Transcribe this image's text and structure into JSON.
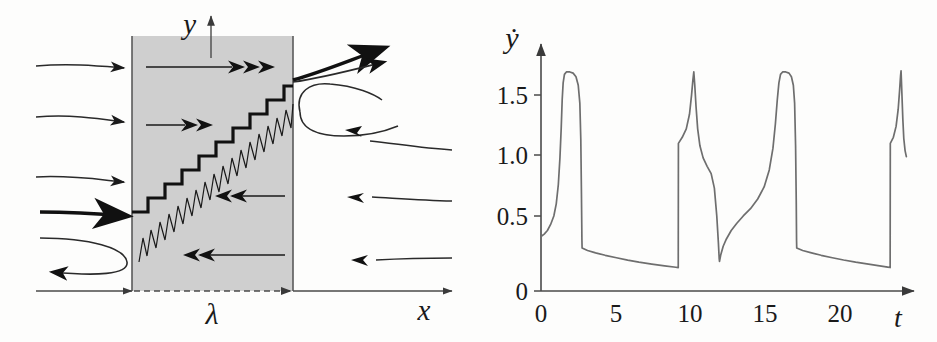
{
  "figure": {
    "panels": [
      {
        "id": "schematic",
        "name": "flow-schematic"
      },
      {
        "id": "plot",
        "name": "velocity-time-plot"
      }
    ]
  },
  "schematic": {
    "axis_x_label": "x",
    "axis_y_label": "y",
    "band_label": "λ",
    "band_fill": "#cfcfcf",
    "band_stroke": "#4a4a4a",
    "line_color": "#1a1a1a",
    "inflow_arrow_count": 4,
    "outflow_arrow_count": 4,
    "interior_right_arrow_count": 2,
    "interior_left_arrow_count": 2,
    "staircase_steps": 9
  },
  "chart_data": {
    "type": "line",
    "title": "",
    "xlabel": "t",
    "ylabel": "ẏ",
    "xlim": [
      0,
      22.8
    ],
    "ylim": [
      0,
      1.95
    ],
    "xticks": [
      0,
      5,
      10,
      15,
      20
    ],
    "xtick_labels": [
      "0",
      "5",
      "10",
      "15",
      "20"
    ],
    "yticks": [
      0,
      0.5,
      1.0,
      1.5
    ],
    "ytick_labels": [
      "0",
      "0.5",
      "1.0",
      "1.5"
    ],
    "grid": false,
    "legend": null,
    "line_color": "#6e6e6e",
    "series": [
      {
        "name": "ydot",
        "points": [
          [
            0.0,
            0.45
          ],
          [
            0.2,
            0.47
          ],
          [
            0.4,
            0.5
          ],
          [
            0.6,
            0.55
          ],
          [
            0.8,
            0.62
          ],
          [
            0.95,
            0.72
          ],
          [
            1.08,
            0.88
          ],
          [
            1.18,
            1.1
          ],
          [
            1.26,
            1.35
          ],
          [
            1.32,
            1.58
          ],
          [
            1.38,
            1.72
          ],
          [
            1.46,
            1.79
          ],
          [
            1.58,
            1.81
          ],
          [
            1.8,
            1.81
          ],
          [
            2.0,
            1.8
          ],
          [
            2.18,
            1.77
          ],
          [
            2.32,
            1.7
          ],
          [
            2.42,
            1.55
          ],
          [
            2.48,
            1.25
          ],
          [
            2.52,
            0.8
          ],
          [
            2.55,
            0.42
          ],
          [
            2.56,
            0.355
          ],
          [
            2.9,
            0.335
          ],
          [
            3.4,
            0.315
          ],
          [
            4.0,
            0.295
          ],
          [
            4.7,
            0.275
          ],
          [
            5.4,
            0.255
          ],
          [
            6.1,
            0.238
          ],
          [
            6.9,
            0.222
          ],
          [
            7.7,
            0.208
          ],
          [
            8.4,
            0.196
          ],
          [
            8.55,
            0.193
          ],
          [
            8.56,
            1.22
          ],
          [
            8.8,
            1.27
          ],
          [
            9.05,
            1.34
          ],
          [
            9.25,
            1.46
          ],
          [
            9.38,
            1.62
          ],
          [
            9.46,
            1.74
          ],
          [
            9.52,
            1.81
          ],
          [
            9.58,
            1.7
          ],
          [
            9.66,
            1.52
          ],
          [
            9.76,
            1.34
          ],
          [
            9.9,
            1.2
          ],
          [
            10.1,
            1.1
          ],
          [
            10.35,
            1.03
          ],
          [
            10.6,
            0.97
          ],
          [
            10.8,
            0.85
          ],
          [
            10.95,
            0.62
          ],
          [
            11.05,
            0.4
          ],
          [
            11.1,
            0.27
          ],
          [
            11.12,
            0.245
          ],
          [
            11.2,
            0.3
          ],
          [
            11.35,
            0.37
          ],
          [
            11.55,
            0.43
          ],
          [
            11.85,
            0.5
          ],
          [
            12.2,
            0.56
          ],
          [
            12.6,
            0.62
          ],
          [
            13.05,
            0.68
          ],
          [
            13.5,
            0.76
          ],
          [
            13.9,
            0.86
          ],
          [
            14.22,
            1.0
          ],
          [
            14.45,
            1.18
          ],
          [
            14.6,
            1.38
          ],
          [
            14.72,
            1.58
          ],
          [
            14.82,
            1.72
          ],
          [
            14.92,
            1.79
          ],
          [
            15.05,
            1.81
          ],
          [
            15.25,
            1.81
          ],
          [
            15.45,
            1.8
          ],
          [
            15.6,
            1.77
          ],
          [
            15.72,
            1.7
          ],
          [
            15.8,
            1.55
          ],
          [
            15.86,
            1.2
          ],
          [
            15.9,
            0.75
          ],
          [
            15.92,
            0.42
          ],
          [
            15.93,
            0.355
          ],
          [
            16.3,
            0.335
          ],
          [
            16.85,
            0.315
          ],
          [
            17.45,
            0.295
          ],
          [
            18.15,
            0.275
          ],
          [
            18.85,
            0.256
          ],
          [
            19.6,
            0.238
          ],
          [
            20.4,
            0.222
          ],
          [
            21.1,
            0.208
          ],
          [
            21.6,
            0.197
          ],
          [
            21.75,
            0.194
          ],
          [
            21.76,
            1.22
          ],
          [
            21.95,
            1.27
          ],
          [
            22.12,
            1.36
          ],
          [
            22.25,
            1.5
          ],
          [
            22.34,
            1.66
          ],
          [
            22.4,
            1.78
          ],
          [
            22.43,
            1.82
          ],
          [
            22.48,
            1.64
          ],
          [
            22.54,
            1.42
          ],
          [
            22.6,
            1.26
          ],
          [
            22.68,
            1.16
          ],
          [
            22.76,
            1.11
          ]
        ]
      }
    ]
  }
}
